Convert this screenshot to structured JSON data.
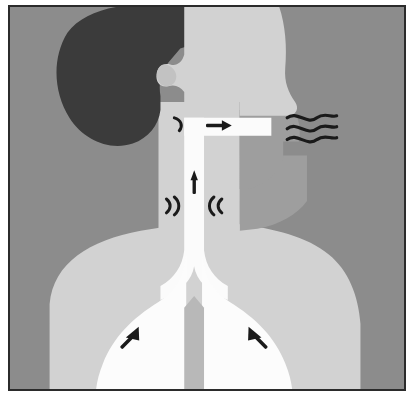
{
  "illustration": {
    "title": "Human respiratory and vocal tract, side profile",
    "subject": "Airflow from lungs through trachea and larynx out of the mouth",
    "orientation": "profile facing right",
    "frame": {
      "border_color": "#2b2b2b",
      "page_background": "#ffffff",
      "scene_background": "#8c8c8c"
    },
    "palette": {
      "background_gray": "#8c8c8c",
      "hair_dark": "#3b3b3b",
      "skin_light": "#d2d2d2",
      "body_mid_gray": "#9e9e9e",
      "airway_white": "#fbfbfb",
      "lung_white": "#fcfcfc",
      "ink_black": "#1a1a1a"
    },
    "parts": [
      {
        "id": "hair",
        "label": "Hair",
        "color": "#3b3b3b"
      },
      {
        "id": "head",
        "label": "Head and face profile",
        "color": "#d2d2d2"
      },
      {
        "id": "ear",
        "label": "Ear notch",
        "color": "#d2d2d2"
      },
      {
        "id": "neck",
        "label": "Neck",
        "color": "#d2d2d2"
      },
      {
        "id": "jaw",
        "label": "Jaw and chin",
        "color": "#9e9e9e"
      },
      {
        "id": "torso",
        "label": "Chest and shoulders",
        "color": "#d2d2d2"
      },
      {
        "id": "mouth",
        "label": "Mouth and oral cavity",
        "color": "#fbfbfb"
      },
      {
        "id": "pharynx",
        "label": "Pharynx",
        "color": "#fbfbfb"
      },
      {
        "id": "larynx",
        "label": "Larynx and vocal cords",
        "color": "#fbfbfb"
      },
      {
        "id": "trachea",
        "label": "Trachea",
        "color": "#fbfbfb"
      },
      {
        "id": "bronchi",
        "label": "Bronchi",
        "color": "#fbfbfb"
      },
      {
        "id": "lung-left",
        "label": "Left lung",
        "color": "#fcfcfc"
      },
      {
        "id": "lung-right",
        "label": "Right lung",
        "color": "#fcfcfc"
      }
    ],
    "annotations": [
      {
        "id": "mouth-airflow-arrow",
        "label": "Airflow out through mouth",
        "glyph": "arrow-right",
        "direction": "right",
        "color": "#1a1a1a"
      },
      {
        "id": "soft-palate-mark",
        "label": "Soft palate vibration arc",
        "glyph": "arc",
        "color": "#1a1a1a"
      },
      {
        "id": "larynx-airflow-arrow",
        "label": "Air rising through larynx",
        "glyph": "arrow-up",
        "direction": "up",
        "color": "#1a1a1a"
      },
      {
        "id": "vocal-cord-left-mark",
        "label": "Left vocal cord vibration",
        "glyph": "double-arc-left",
        "color": "#1a1a1a"
      },
      {
        "id": "vocal-cord-right-mark",
        "label": "Right vocal cord vibration",
        "glyph": "double-arc-right",
        "color": "#1a1a1a"
      },
      {
        "id": "sound-waves",
        "label": "Sound waves leaving the mouth",
        "glyph": "three-wavy-lines",
        "count": 3,
        "color": "#1a1a1a"
      },
      {
        "id": "lung-left-arrow",
        "label": "Left lung compression",
        "glyph": "arrow-up-right",
        "direction": "up-right",
        "color": "#1a1a1a"
      },
      {
        "id": "lung-right-arrow",
        "label": "Right lung compression",
        "glyph": "arrow-up-left",
        "direction": "up-left",
        "color": "#1a1a1a"
      }
    ]
  }
}
